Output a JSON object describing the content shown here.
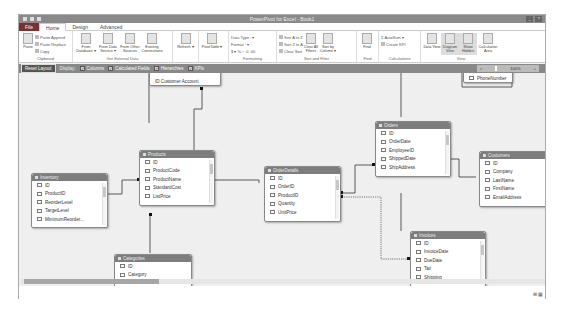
{
  "window": {
    "title": "PowerPivot for Excel - Book1",
    "controls": [
      "_",
      "?"
    ]
  },
  "tabs": [
    {
      "label": "File"
    },
    {
      "label": "Home"
    },
    {
      "label": "Design"
    },
    {
      "label": "Advanced"
    }
  ],
  "ribbon": {
    "clipboard": {
      "label": "Clipboard",
      "paste": "Paste",
      "items": [
        "Paste Append",
        "Paste Replace",
        "Copy"
      ]
    },
    "external": {
      "label": "Get External Data",
      "buttons": [
        "From Database ▾",
        "From Data Service ▾",
        "From Other Sources",
        "Existing Connections"
      ]
    },
    "refresh": "Refresh ▾",
    "pivot": "PivotTable ▾",
    "formatting": {
      "label": "Formatting",
      "items": [
        "Data Type : ▾",
        "Format : ▾",
        "$ ▾ % ↑ .0 .00"
      ]
    },
    "sort": {
      "label": "Sort and Filter",
      "items": [
        "Sort A to Z",
        "Sort Z to A",
        "Clear Sort"
      ],
      "buttons": [
        "Clear All Filters",
        "Sort by Column ▾"
      ]
    },
    "find": {
      "label": "Find",
      "button": "Find"
    },
    "calc": {
      "label": "Calculations",
      "items": [
        "AutoSum ▾",
        "Create KPI"
      ]
    },
    "view": {
      "label": "View",
      "buttons": [
        "Data View",
        "Diagram View",
        "Show Hidden",
        "Calculation Area"
      ]
    }
  },
  "toolbar": {
    "reset": "Reset Layout",
    "display": "Display:",
    "checkboxes": [
      {
        "label": "Columns",
        "checked": true
      },
      {
        "label": "Calculated Fields",
        "checked": true
      },
      {
        "label": "Hierarchies",
        "checked": true
      },
      {
        "label": "KPIs",
        "checked": true
      }
    ],
    "zoom": "100%"
  },
  "tables": {
    "partial_top": {
      "field": "ID  Customer Account"
    },
    "partial_top_right": {
      "field": "PhoneNumber"
    },
    "inventory": {
      "name": "Inventory",
      "fields": [
        "ID",
        "ProductID",
        "ReorderLevel",
        "TargetLevel",
        "MinimumReorder..."
      ]
    },
    "products": {
      "name": "Products",
      "fields": [
        "ID",
        "ProductCode",
        "ProductName",
        "StandardCost",
        "ListPrice"
      ]
    },
    "orderdetails": {
      "name": "OrderDetails",
      "fields": [
        "ID",
        "OrderID",
        "ProductID",
        "Quantity",
        "UnitPrice"
      ]
    },
    "orders": {
      "name": "Orders",
      "fields": [
        "ID",
        "OrderDate",
        "EmployeeID",
        "ShippedDate",
        "ShipAddress"
      ]
    },
    "customers": {
      "name": "Customers",
      "fields": [
        "ID",
        "Company",
        "LastName",
        "FirstName",
        "EmailAddress"
      ]
    },
    "invoices": {
      "name": "Invoices",
      "fields": [
        "ID",
        "InvoiceDate",
        "DueDate",
        "Tax",
        "Shipping"
      ]
    },
    "categories": {
      "name": "Categories",
      "fields": [
        "ID",
        "Category"
      ]
    }
  },
  "status": {
    "view_icons": "⊞ ▦"
  }
}
